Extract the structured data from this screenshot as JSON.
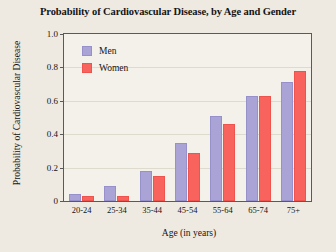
{
  "chart_data": {
    "type": "bar",
    "title": "Probability of Cardiovascular Disease, by Age and Gender",
    "xlabel": "Age (in years)",
    "ylabel": "Probability of Cardiovascular Disease",
    "categories": [
      "20-24",
      "25-34",
      "35-44",
      "45-54",
      "55-64",
      "65-74",
      "75+"
    ],
    "series": [
      {
        "name": "Men",
        "color": "#a9a3d6",
        "values": [
          0.04,
          0.09,
          0.18,
          0.35,
          0.51,
          0.63,
          0.71
        ]
      },
      {
        "name": "Women",
        "color": "#f8635d",
        "values": [
          0.03,
          0.03,
          0.15,
          0.29,
          0.46,
          0.63,
          0.78
        ]
      }
    ],
    "ylim": [
      0,
      1.0
    ],
    "ytick_labels": [
      "1.0",
      "0.8",
      "0.6",
      "0.4",
      "0.2",
      "0"
    ],
    "ytick_values": [
      1.0,
      0.8,
      0.6,
      0.4,
      0.2,
      0
    ],
    "grid": true,
    "legend_position": "top-left-inside"
  },
  "legend": {
    "entries": [
      {
        "label": "Men"
      },
      {
        "label": "Women"
      }
    ]
  }
}
